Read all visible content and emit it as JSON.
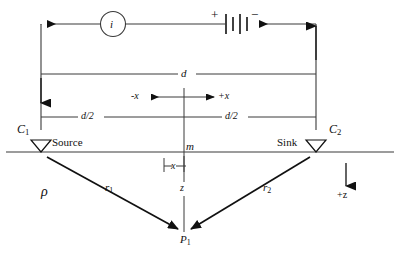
{
  "figure": {
    "type": "schematic-diagram",
    "colors": {
      "line": "#3a3a3a",
      "heavy_line": "#111111",
      "text": "#111111",
      "background": "#ffffff"
    }
  },
  "circuit": {
    "current_meter_label": "i",
    "battery": {
      "positive_label": "+",
      "negative_label": "−",
      "plate_count": 4
    }
  },
  "dimensions": {
    "total_span_label": "d",
    "half_span_left_label": "d/2",
    "half_span_right_label": "d/2",
    "negative_x_label": "-x",
    "positive_x_label": "+x",
    "offset_label": "x"
  },
  "electrodes": [
    {
      "id": "c1",
      "name_label": "C",
      "name_subscript": "1",
      "role_label": "Source"
    },
    {
      "id": "c2",
      "name_label": "C",
      "name_subscript": "2",
      "role_label": "Sink"
    }
  ],
  "ground": {
    "resistivity_label": "ρ",
    "origin_label": "m",
    "depth_axis_label": "z",
    "depth_direction_label": "+z"
  },
  "rays": [
    {
      "id": "r1",
      "label": "r",
      "subscript": "1"
    },
    {
      "id": "r2",
      "label": "r",
      "subscript": "2"
    }
  ],
  "target_point": {
    "label": "P",
    "subscript": "1"
  }
}
